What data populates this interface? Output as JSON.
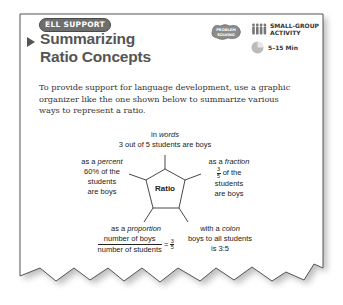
{
  "header": {
    "badge_label": "ELL SUPPORT",
    "title_line1": "Summarizing",
    "title_line2": "Ratio Concepts",
    "problem_solving_badge": "PROBLEM SOLVING",
    "activity_label_line1": "SMALL-GROUP",
    "activity_label_line2": "ACTIVITY",
    "time_label": "5–15 Min",
    "icons": [
      "play-arrow-icon",
      "problem-solving-icon",
      "group-people-icon",
      "clock-icon"
    ]
  },
  "body": {
    "paragraph": "To provide support for language development, use a graphic organizer like the one shown below to summarize various ways to represent a ratio."
  },
  "diagram": {
    "center_label": "Ratio",
    "words": {
      "prefix": "in ",
      "emph": "words",
      "line2": "3 out of 5 students are boys"
    },
    "percent": {
      "prefix": "as a ",
      "emph": "percent",
      "line2": "60% of the",
      "line3": "students",
      "line4": "are boys"
    },
    "fraction": {
      "prefix": "as a ",
      "emph": "fraction",
      "num": "3",
      "den": "5",
      "line2_suffix": " of the",
      "line3": "students",
      "line4": "are boys"
    },
    "proportion": {
      "prefix": "as a ",
      "emph": "proportion",
      "num": "number of boys",
      "den": "number of students",
      "eq": "=",
      "rnum": "3",
      "rden": "5"
    },
    "colon": {
      "prefix": "with a ",
      "emph": "colon",
      "line2": "boys to all students",
      "line3": "is 3:5"
    }
  },
  "colors": {
    "border": "#555555",
    "title": "#555555",
    "badge_bg": "#6e6e6e",
    "text": "#333333"
  }
}
